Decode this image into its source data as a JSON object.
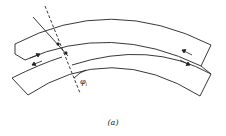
{
  "figure": {
    "caption": "(a)",
    "angle_label": "φ",
    "angle_subscript": "i"
  },
  "colors": {
    "line": "#222222",
    "background": "#ffffff"
  }
}
